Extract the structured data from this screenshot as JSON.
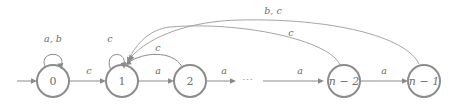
{
  "diagram": {
    "kind": "finite-state-automaton",
    "title": "",
    "colors": {
      "node_stroke": "#8c8c8c",
      "edge_stroke": "#8a8a8a",
      "text": "#6f6f6f",
      "background": "#ffffff"
    },
    "states": [
      {
        "id": "s0",
        "label": "0",
        "cx": 53,
        "cy": 81,
        "r": 16
      },
      {
        "id": "s1",
        "label": "1",
        "cx": 122,
        "cy": 81,
        "r": 16
      },
      {
        "id": "s2",
        "label": "2",
        "cx": 190,
        "cy": 81,
        "r": 16
      },
      {
        "id": "sn2",
        "label": "n − 2",
        "cx": 344,
        "cy": 81,
        "r": 16
      },
      {
        "id": "sn1",
        "label": "n − 1",
        "cx": 424,
        "cy": 81,
        "r": 16
      }
    ],
    "start_state": "s0",
    "ellipsis": {
      "text": "⋯",
      "x": 248,
      "y": 81
    },
    "transitions": [
      {
        "id": "t-start",
        "from": "",
        "to": "s0",
        "label": "",
        "kind": "initial-arrow"
      },
      {
        "id": "t-0-0",
        "from": "s0",
        "to": "s0",
        "label": "a, b",
        "kind": "self-loop",
        "label_x": 53,
        "label_y": 39
      },
      {
        "id": "t-0-1",
        "from": "s0",
        "to": "s1",
        "label": "c",
        "kind": "straight",
        "label_x": 89,
        "label_y": 71
      },
      {
        "id": "t-1-1",
        "from": "s1",
        "to": "s1",
        "label": "c",
        "kind": "self-loop",
        "label_x": 110,
        "label_y": 39
      },
      {
        "id": "t-1-2",
        "from": "s1",
        "to": "s2",
        "label": "a",
        "kind": "straight",
        "label_x": 158,
        "label_y": 71
      },
      {
        "id": "t-2-1",
        "from": "s2",
        "to": "s1",
        "label": "c",
        "kind": "arc",
        "label_x": 158,
        "label_y": 48
      },
      {
        "id": "t-2-dots",
        "from": "s2",
        "to": "",
        "label": "a",
        "kind": "straight",
        "label_x": 224,
        "label_y": 71
      },
      {
        "id": "t-dots-n2",
        "from": "",
        "to": "sn2",
        "label": "a",
        "kind": "straight",
        "label_x": 300,
        "label_y": 71
      },
      {
        "id": "t-n2-n1",
        "from": "sn2",
        "to": "sn1",
        "label": "a",
        "kind": "straight",
        "label_x": 384,
        "label_y": 71
      },
      {
        "id": "t-n2-1",
        "from": "sn2",
        "to": "s1",
        "label": "c",
        "kind": "long-arc",
        "label_x": 291,
        "label_y": 33
      },
      {
        "id": "t-n1-1",
        "from": "sn1",
        "to": "s1",
        "label": "b, c",
        "kind": "long-arc",
        "label_x": 273,
        "label_y": 11
      }
    ]
  }
}
